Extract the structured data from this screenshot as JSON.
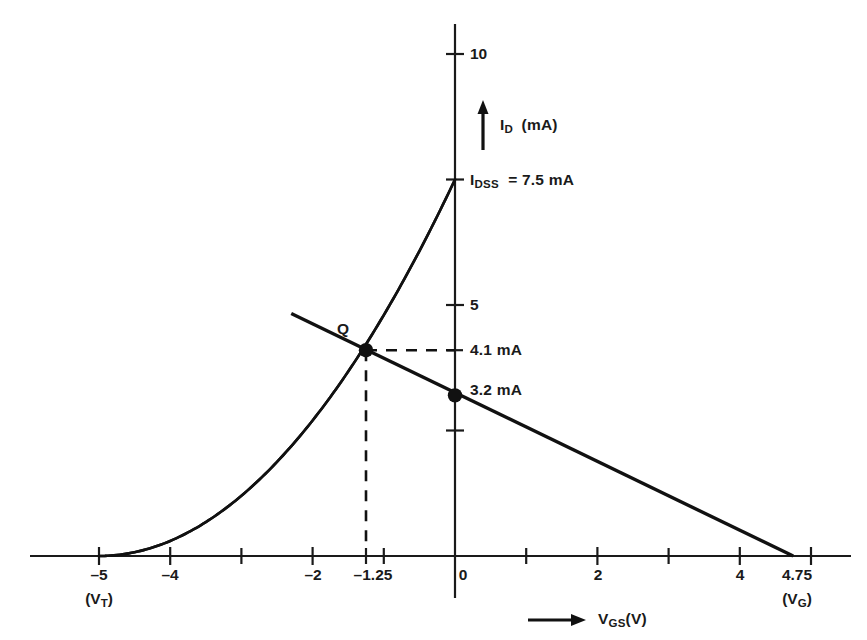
{
  "chart_data": {
    "type": "line",
    "title": "",
    "xlabel": "V_GS(V)",
    "ylabel": "I_D (mA)",
    "xlabel_text": "V",
    "xlabel_sub": "GS",
    "xlabel_unit": "(V)",
    "ylabel_text": "I",
    "ylabel_sub": "D",
    "ylabel_unit": "(mA)",
    "xlim": [
      -5.9,
      5.55
    ],
    "ylim": [
      0,
      10.6
    ],
    "grid": false,
    "legend": "none",
    "x_ticks": [
      -5,
      -4,
      -3,
      -2,
      -1,
      0,
      1,
      2,
      3,
      4,
      5
    ],
    "x_tick_labels": [
      "-5",
      "-4",
      "",
      "-2",
      "",
      "0",
      "",
      "2",
      "",
      "4",
      ""
    ],
    "x_extra_ticks": [
      -1.25,
      4.75
    ],
    "x_extra_tick_labels": [
      "-1.25",
      "4.75"
    ],
    "y_ticks": [
      2.5,
      5,
      7.5,
      10
    ],
    "y_tick_labels": [
      "",
      "5",
      "",
      "10"
    ],
    "series": [
      {
        "name": "transfer-curve",
        "type": "shockley-parabola",
        "description": "JFET transfer characteristic I_D = I_DSS(1 - V_GS/V_T)^2",
        "v_t": -5,
        "i_dss": 7.5,
        "x_from": -5,
        "x_to": 0,
        "points": [
          [
            -5.0,
            0.0
          ],
          [
            -4.5,
            0.075
          ],
          [
            -4.0,
            0.3
          ],
          [
            -3.5,
            0.675
          ],
          [
            -3.0,
            1.2
          ],
          [
            -2.5,
            1.875
          ],
          [
            -2.0,
            2.7
          ],
          [
            -1.5,
            3.675
          ],
          [
            -1.25,
            4.219
          ],
          [
            -1.0,
            4.8
          ],
          [
            -0.5,
            6.075
          ],
          [
            0.0,
            7.5
          ]
        ]
      },
      {
        "name": "bias-load-line",
        "type": "line",
        "description": "Gate bias load line through Q point",
        "points": [
          [
            -2.3,
            4.83
          ],
          [
            -1.25,
            4.1
          ],
          [
            0.0,
            3.2
          ],
          [
            4.75,
            0.0
          ]
        ],
        "x_intercept": 4.75,
        "y_intercept": 3.2
      }
    ],
    "annotations": [
      {
        "name": "q-point-label",
        "text": "Q",
        "x": -1.45,
        "y": 4.65
      },
      {
        "name": "idss-label",
        "text": "I",
        "sub": "DSS",
        "tail": " = 7.5 mA",
        "x": 0.18,
        "y": 7.5
      },
      {
        "name": "id-4p1-label",
        "text": "4.1 mA",
        "x": 0.25,
        "y": 4.1
      },
      {
        "name": "id-3p2-label",
        "text": "3.2 mA",
        "x": 0.22,
        "y": 3.45
      },
      {
        "name": "vt-label",
        "text": "(V",
        "sub": "T",
        "tail": ")",
        "x": -5,
        "y": -1.1
      },
      {
        "name": "vg-label",
        "text": "(V",
        "sub": "G",
        "tail": ")",
        "x": 4.75,
        "y": -1.1
      }
    ],
    "markers": [
      {
        "name": "q-point",
        "x": -1.25,
        "y": 4.1,
        "label": "Q"
      },
      {
        "name": "zero-bias-point",
        "x": 0.0,
        "y": 3.2,
        "label": "3.2 mA"
      }
    ],
    "guide_lines": [
      {
        "name": "q-vertical-dashed",
        "from": [
          -1.25,
          0
        ],
        "to": [
          -1.25,
          4.1
        ],
        "style": "dashed"
      },
      {
        "name": "q-horizontal-dashed",
        "from": [
          -1.25,
          4.1
        ],
        "to": [
          0,
          4.1
        ],
        "style": "dashed"
      }
    ],
    "values": {
      "i_dss": "7.5 mA",
      "v_t": "-5",
      "v_g": "4.75",
      "q_current": "4.1 mA",
      "zero_bias_current": "3.2 mA",
      "q_voltage": "-1.25"
    },
    "colors": {
      "ink": "#111111",
      "background": "#ffffff"
    }
  },
  "labels": {
    "x_axis_title_main": "V",
    "x_axis_title_sub": "GS",
    "x_axis_title_unit": "(V)",
    "y_axis_title_main": "I",
    "y_axis_title_sub": "D",
    "y_axis_title_unit": "(mA)",
    "q": "Q",
    "idss_main": "I",
    "idss_sub": "DSS",
    "idss_value": "= 7.5 mA",
    "current_41": "4.1 mA",
    "current_32": "3.2 mA",
    "vt_open": "(V",
    "vt_sub": "T",
    "vt_close": ")",
    "vg_open": "(V",
    "vg_sub": "G",
    "vg_close": ")",
    "tick_m5": "–5",
    "tick_m4": "–4",
    "tick_m2": "–2",
    "tick_m125": "–1.25",
    "tick_0": "0",
    "tick_2": "2",
    "tick_4": "4",
    "tick_475": "4.75",
    "tick_y5": "5",
    "tick_y10": "10"
  }
}
